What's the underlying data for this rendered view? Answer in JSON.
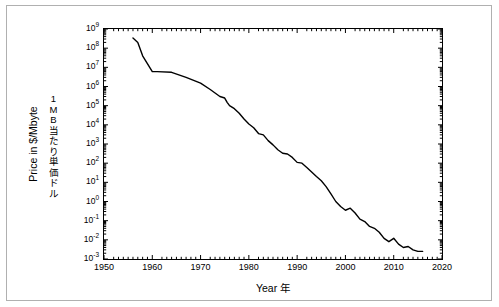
{
  "figure": {
    "background": "#ffffff",
    "line_color": "#000000",
    "frame_color": "#b0b0b0"
  },
  "labels": {
    "xlabel": "Year  年",
    "ylabel_en": "Price in $/Mbyte",
    "ylabel_jp_chars": [
      "1",
      "M",
      "B",
      "当",
      "た",
      "り",
      "単",
      "価",
      "ド",
      "ル"
    ]
  },
  "chart_data": {
    "type": "line",
    "title": "",
    "xlabel": "Year  年",
    "ylabel": "Price in $/Mbyte",
    "ylabel_secondary": "1MB当たり単価ドル",
    "yscale": "log",
    "xlim": [
      1950,
      2020
    ],
    "ylim": [
      0.001,
      1000000000
    ],
    "grid": false,
    "legend": null,
    "xticks": [
      1950,
      1960,
      1970,
      1980,
      1990,
      2000,
      2010,
      2020
    ],
    "xtick_labels": [
      "1950",
      "1960",
      "1970",
      "1980",
      "1990",
      "2000",
      "2010",
      "2020"
    ],
    "yticks": [
      0.001,
      0.01,
      0.1,
      1,
      10,
      100,
      1000,
      10000,
      100000,
      1000000,
      10000000,
      100000000,
      1000000000
    ],
    "ytick_labels": [
      "10-3",
      "10-2",
      "10-1",
      "100",
      "101",
      "102",
      "103",
      "104",
      "105",
      "106",
      "107",
      "108",
      "109"
    ],
    "ytick_mantissa": "10",
    "ytick_exponents": [
      "-3",
      "-2",
      "-1",
      "0",
      "1",
      "2",
      "3",
      "4",
      "5",
      "6",
      "7",
      "8",
      "9"
    ],
    "series": [
      {
        "name": "Hard drive cost per megabyte",
        "x": [
          1956,
          1957,
          1958,
          1960,
          1961,
          1964,
          1967,
          1970,
          1972,
          1974,
          1975,
          1975.5,
          1976,
          1977,
          1978,
          1979,
          1980,
          1981,
          1982,
          1983,
          1984,
          1985,
          1986,
          1987,
          1988,
          1989,
          1990,
          1991,
          1992,
          1993,
          1994,
          1995,
          1996,
          1997,
          1998,
          1999,
          2000,
          2001,
          2002,
          2003,
          2004,
          2005,
          2006,
          2007,
          2008,
          2009,
          2010,
          2011,
          2012,
          2013,
          2014,
          2015,
          2016
        ],
        "y": [
          340000000.0,
          200000000.0,
          40000000.0,
          6000000.0,
          6000000.0,
          5500000.0,
          3000000.0,
          1500000.0,
          700000.0,
          300000.0,
          250000.0,
          150000.0,
          100000.0,
          70000.0,
          40000.0,
          20000.0,
          11000.0,
          7000.0,
          3500.0,
          3000.0,
          1500.0,
          900.0,
          500.0,
          330.0,
          300.0,
          200.0,
          110.0,
          100.0,
          60.0,
          35.0,
          20.0,
          12.0,
          6.0,
          2.5,
          1.0,
          0.55,
          0.35,
          0.45,
          0.25,
          0.12,
          0.09,
          0.05,
          0.04,
          0.025,
          0.012,
          0.008,
          0.012,
          0.006,
          0.004,
          0.0045,
          0.003,
          0.0025,
          0.0025
        ]
      }
    ]
  }
}
